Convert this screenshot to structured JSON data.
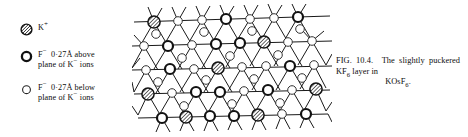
{
  "figure": {
    "domain": "scientific-crystallography-figure",
    "background_color": "#ffffff",
    "ink_color": "#111111"
  },
  "legend": {
    "items": [
      {
        "symbol": "hatched-circle",
        "species": "K",
        "charge": "+",
        "line1_prefix": "",
        "line1": "",
        "line2": "",
        "label_html": "K"
      },
      {
        "symbol": "thick-open-circle",
        "species": "F",
        "charge": "−",
        "distance": "0·27Å",
        "direction": "above",
        "line1": "0·27Å above",
        "line2": "plane of K",
        "line2_tail": " ions"
      },
      {
        "symbol": "thin-open-circle",
        "species": "F",
        "charge": "−",
        "distance": "0·27Å",
        "direction": "below",
        "line1": "0·27Å below",
        "line2": "plane of K",
        "line2_tail": " ions"
      }
    ]
  },
  "caption": {
    "figure_number": "FIG. 10.4.",
    "text_part1": "The slightly puckered KF",
    "subscript1": "6",
    "text_part2": " layer in",
    "compound_prefix": "KOsF",
    "compound_subscript": "6",
    "compound_suffix": "."
  },
  "diagram": {
    "node_types": {
      "potassium": "hatched-circle",
      "fluorine_above": "thick-open-circle",
      "fluorine_below": "thin-open-circle"
    },
    "counts": {
      "potassium": 10,
      "fluorine_above": 22,
      "fluorine_below": 31
    }
  }
}
